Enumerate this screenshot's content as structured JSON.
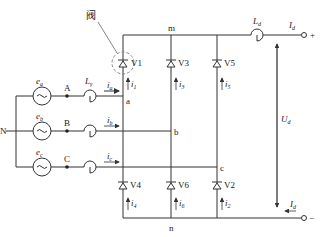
{
  "diagram": {
    "valve_label": "阀",
    "neutral_label": "N",
    "sources": [
      {
        "name": "e",
        "sub": "a",
        "node": "A"
      },
      {
        "name": "e",
        "sub": "b",
        "node": "B"
      },
      {
        "name": "e",
        "sub": "c",
        "node": "C"
      }
    ],
    "line_inductor": {
      "name": "L",
      "sub": "γ"
    },
    "line_currents": [
      {
        "name": "i",
        "sub": "a"
      },
      {
        "name": "i",
        "sub": "b"
      },
      {
        "name": "i",
        "sub": "c"
      }
    ],
    "phase_nodes": [
      "a",
      "b",
      "c"
    ],
    "top_rail_label": "m",
    "bottom_rail_label": "n",
    "upper_valves": [
      {
        "label": "V1",
        "current": "i",
        "current_sub": "1"
      },
      {
        "label": "V3",
        "current": "i",
        "current_sub": "3"
      },
      {
        "label": "V5",
        "current": "i",
        "current_sub": "5"
      }
    ],
    "lower_valves": [
      {
        "label": "V4",
        "current": "i",
        "current_sub": "4"
      },
      {
        "label": "V6",
        "current": "i",
        "current_sub": "6"
      },
      {
        "label": "V2",
        "current": "i",
        "current_sub": "2"
      }
    ],
    "dc_inductor": {
      "name": "L",
      "sub": "d"
    },
    "dc_current": {
      "name": "I",
      "sub": "d"
    },
    "dc_voltage": {
      "name": "U",
      "sub": "d"
    },
    "terminals": {
      "positive": "+",
      "negative": "−"
    },
    "colors": {
      "line": "#333333",
      "valve_highlight": "#888888"
    }
  }
}
